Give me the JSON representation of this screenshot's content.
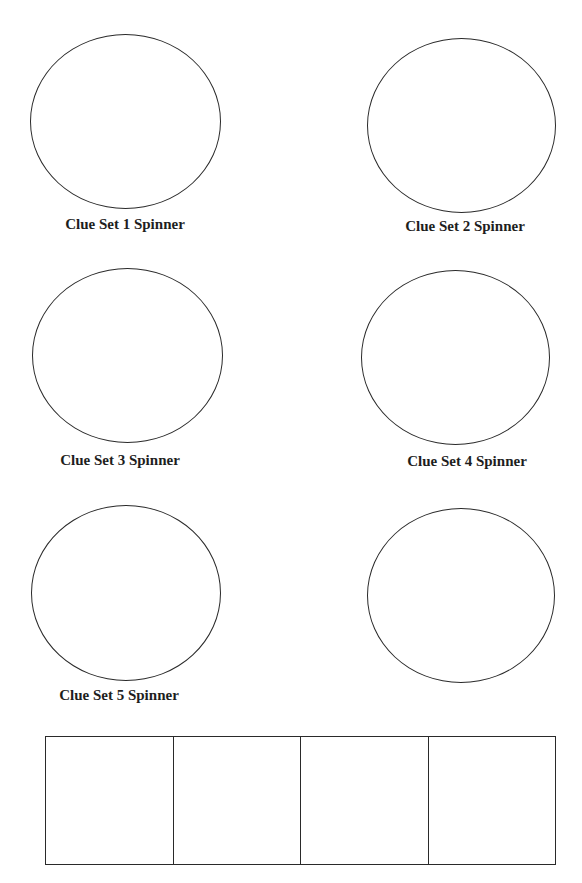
{
  "page": {
    "spinners": [
      {
        "id": 1,
        "label": "Clue Set 1 Spinner"
      },
      {
        "id": 2,
        "label": "Clue Set 2 Spinner"
      },
      {
        "id": 3,
        "label": "Clue Set 3 Spinner"
      },
      {
        "id": 4,
        "label": "Clue Set 4 Spinner"
      },
      {
        "id": 5,
        "label": "Clue Set 5 Spinner"
      },
      {
        "id": 6,
        "label": ""
      }
    ],
    "answer_boxes": {
      "count": 4
    }
  }
}
